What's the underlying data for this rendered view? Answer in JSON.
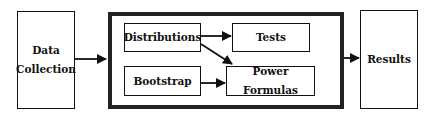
{
  "diagram": {
    "nodes": {
      "data_collection": {
        "line1": "Data",
        "line2": "Collection"
      },
      "distributions": {
        "label": "Distributions"
      },
      "bootstrap": {
        "label": "Bootstrap"
      },
      "tests": {
        "label": "Tests"
      },
      "power_formulas": {
        "label": "Power Formulas"
      },
      "results": {
        "label": "Results"
      }
    },
    "edges": [
      {
        "from": "Data Collection",
        "to": "Analysis Group"
      },
      {
        "from": "Distributions",
        "to": "Tests"
      },
      {
        "from": "Distributions",
        "to": "Power Formulas"
      },
      {
        "from": "Bootstrap",
        "to": "Power Formulas"
      },
      {
        "from": "Analysis Group",
        "to": "Results"
      }
    ],
    "colors": {
      "stroke": "#111111",
      "background": "#ffffff"
    }
  }
}
